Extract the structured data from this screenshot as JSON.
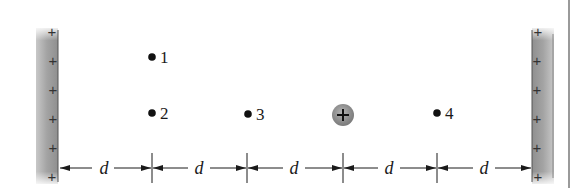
{
  "diagram": {
    "type": "physics-electrostatics",
    "plates": {
      "left": {
        "charge_sign": "+",
        "plus_count": 6
      },
      "right": {
        "charge_sign": "+",
        "plus_count": 6
      }
    },
    "points": [
      {
        "id": "1",
        "label": "1"
      },
      {
        "id": "2",
        "label": "2"
      },
      {
        "id": "3",
        "label": "3"
      },
      {
        "id": "4",
        "label": "4"
      }
    ],
    "charge": {
      "symbol": "+",
      "kind": "positive-particle"
    },
    "dimension": {
      "segments": [
        "d",
        "d",
        "d",
        "d",
        "d"
      ],
      "segment_count": 5
    },
    "colors": {
      "plate_fill": "#9a9a9a",
      "plate_edge": "#555555",
      "charge_fill": "#8c8c8c",
      "ink": "#1a1a1a",
      "border": "#999999"
    }
  }
}
